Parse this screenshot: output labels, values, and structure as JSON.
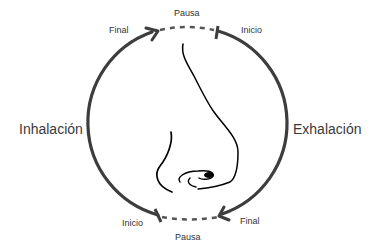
{
  "diagram": {
    "left_phase": "Inhalación",
    "right_phase": "Exhalación",
    "top": {
      "pause": "Pausa",
      "end_label": "Final",
      "start_label": "Inicio"
    },
    "bottom": {
      "pause": "Pausa",
      "start_label": "Inicio",
      "end_label": "Final"
    },
    "center_illustration": "nose-sketch",
    "colors": {
      "arc": "#3d3d3d",
      "text": "#333333",
      "nose": "#000000"
    }
  }
}
